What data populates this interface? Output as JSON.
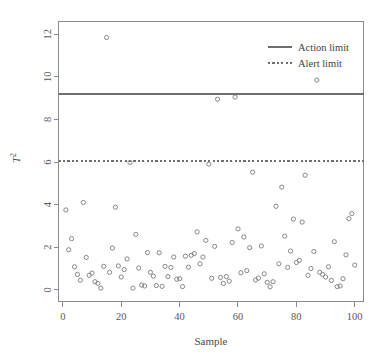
{
  "chart_data": {
    "type": "scatter",
    "title": "",
    "xlabel": "Sample",
    "ylabel": "T²",
    "xlim": [
      -1.5,
      103
    ],
    "ylim": [
      -0.55,
      12.6
    ],
    "xticks": [
      0,
      20,
      40,
      60,
      80,
      100
    ],
    "yticks": [
      0,
      2,
      4,
      6,
      8,
      10,
      12
    ],
    "grid": false,
    "legend_position": "top-right",
    "legend": [
      {
        "label": "Action limit",
        "style": "solid"
      },
      {
        "label": "Alert limit",
        "style": "dashed"
      }
    ],
    "reference_lines": [
      {
        "name": "Action limit",
        "value": 9.2,
        "style": "solid"
      },
      {
        "name": "Alert limit",
        "value": 6.05,
        "style": "dashed"
      }
    ],
    "series": [
      {
        "name": "T2",
        "marker": "open-circle",
        "x": [
          1,
          2,
          3,
          4,
          5,
          6,
          7,
          8,
          9,
          10,
          11,
          12,
          13,
          14,
          15,
          16,
          17,
          18,
          19,
          20,
          21,
          22,
          23,
          24,
          25,
          26,
          27,
          28,
          29,
          30,
          31,
          32,
          33,
          34,
          35,
          36,
          37,
          38,
          39,
          40,
          41,
          42,
          43,
          44,
          45,
          46,
          47,
          48,
          49,
          50,
          51,
          52,
          53,
          54,
          55,
          56,
          57,
          58,
          59,
          60,
          61,
          62,
          63,
          64,
          65,
          66,
          67,
          68,
          69,
          70,
          71,
          72,
          73,
          74,
          75,
          76,
          77,
          78,
          79,
          80,
          81,
          82,
          83,
          84,
          85,
          86,
          87,
          88,
          89,
          90,
          91,
          92,
          93,
          94,
          95,
          96,
          97,
          98,
          99,
          100
        ],
        "y": [
          3.75,
          1.88,
          2.4,
          1.08,
          0.72,
          0.45,
          4.1,
          1.52,
          0.68,
          0.78,
          0.38,
          0.3,
          0.08,
          1.1,
          11.85,
          0.82,
          1.96,
          3.88,
          1.12,
          0.6,
          0.95,
          1.45,
          5.98,
          0.08,
          2.6,
          1.02,
          0.22,
          0.18,
          1.75,
          0.82,
          0.64,
          0.2,
          1.74,
          0.16,
          1.1,
          0.62,
          1.05,
          1.54,
          0.5,
          0.52,
          0.15,
          1.58,
          1.06,
          1.62,
          1.7,
          2.72,
          1.22,
          1.54,
          2.32,
          5.9,
          0.54,
          2.04,
          8.95,
          0.58,
          0.3,
          0.62,
          0.4,
          2.22,
          9.05,
          2.86,
          0.8,
          2.48,
          0.9,
          1.98,
          5.52,
          0.46,
          0.55,
          2.06,
          0.75,
          0.35,
          0.14,
          0.38,
          3.92,
          1.22,
          4.82,
          2.52,
          1.05,
          1.82,
          3.32,
          1.28,
          1.38,
          3.18,
          5.38,
          0.68,
          1.0,
          1.8,
          9.85,
          0.82,
          0.72,
          0.6,
          1.08,
          0.44,
          2.26,
          0.15,
          0.18,
          0.52,
          1.64,
          3.34,
          3.58,
          1.16
        ]
      }
    ]
  }
}
